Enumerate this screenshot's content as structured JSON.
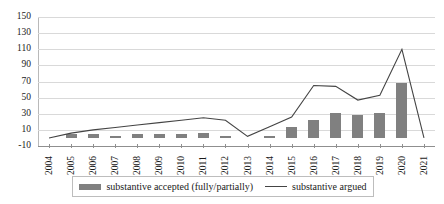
{
  "chart_data": {
    "type": "bar",
    "title": "",
    "subtitle": "",
    "xlabel": "",
    "ylabel": "",
    "ylim": [
      -10,
      150
    ],
    "ytick_step": 20,
    "yticks": [
      150,
      130,
      110,
      90,
      70,
      50,
      30,
      10,
      -10
    ],
    "grid": true,
    "legend_position": "bottom",
    "categories": [
      "2004",
      "2005",
      "2006",
      "2007",
      "2008",
      "2009",
      "2010",
      "2011",
      "2012",
      "2013",
      "2014",
      "2015",
      "2016",
      "2017",
      "2018",
      "2019",
      "2020",
      "2021"
    ],
    "series": [
      {
        "name": "substantive accepted (fully/partially)",
        "type": "bar",
        "color": "#808080",
        "values": [
          0,
          5,
          5,
          2,
          5,
          5,
          5,
          6,
          3,
          0,
          3,
          14,
          22,
          31,
          29,
          31,
          68,
          0
        ]
      },
      {
        "name": "substantive argued",
        "type": "line",
        "color": "#444444",
        "values": [
          0,
          6,
          10,
          13,
          16,
          19,
          22,
          25,
          22,
          2,
          14,
          26,
          65,
          64,
          47,
          53,
          110,
          0
        ]
      }
    ]
  },
  "legend": {
    "entries": [
      {
        "label": "substantive accepted (fully/partially)",
        "marker": "bar-swatch"
      },
      {
        "label": "substantive argued",
        "marker": "line-swatch"
      }
    ]
  },
  "axes": {
    "y_tick_labels": [
      "150",
      "130",
      "110",
      "90",
      "70",
      "50",
      "30",
      "10",
      "-10"
    ],
    "x_tick_labels": [
      "2004",
      "2005",
      "2006",
      "2007",
      "2008",
      "2009",
      "2010",
      "2011",
      "2012",
      "2013",
      "2014",
      "2015",
      "2016",
      "2017",
      "2018",
      "2019",
      "2020",
      "2021"
    ]
  }
}
